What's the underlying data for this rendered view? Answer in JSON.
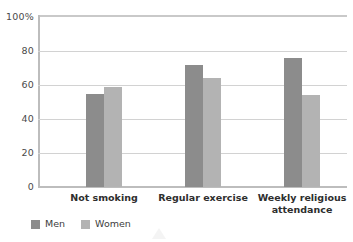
{
  "chart_data": {
    "type": "bar",
    "title": "",
    "subtitle": "",
    "xlabel": "",
    "ylabel": "",
    "ylim": [
      0,
      100
    ],
    "y_ticks": [
      0,
      20,
      40,
      60,
      80,
      100
    ],
    "y_tick_labels": [
      "0",
      "20",
      "40",
      "60",
      "80",
      "100%"
    ],
    "grid": true,
    "legend_position": "bottom-left",
    "categories": [
      "Not smoking",
      "Regular exercise",
      "Weekly religious\nattendance"
    ],
    "series": [
      {
        "name": "Men",
        "color": "#8c8c8c",
        "values": [
          55,
          72,
          76
        ]
      },
      {
        "name": "Women",
        "color": "#b3b3b3",
        "values": [
          59,
          64,
          54
        ]
      }
    ]
  },
  "legend": {
    "items": [
      {
        "label": "Men",
        "color": "#8c8c8c"
      },
      {
        "label": "Women",
        "color": "#b3b3b3"
      }
    ]
  },
  "colors": {
    "men": "#8c8c8c",
    "women": "#b3b3b3",
    "gridline": "#d2d2d2",
    "axis": "#bdbdbd",
    "text": "#3a3a3a",
    "background": "#ffffff"
  }
}
